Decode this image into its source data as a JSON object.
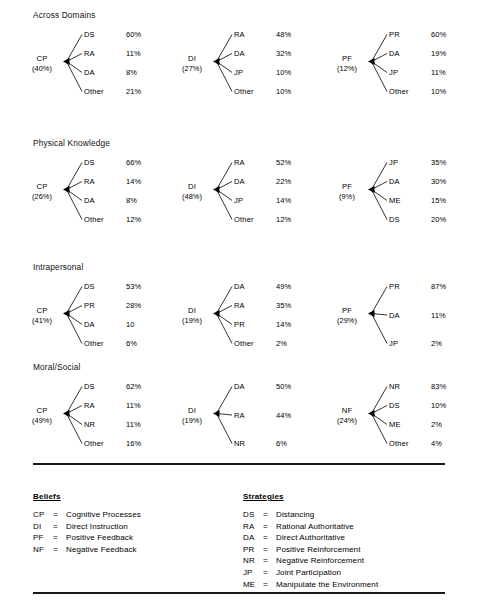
{
  "document": {
    "type": "tree-diagram-figure",
    "background_color": "#ffffff",
    "text_color": "#000000",
    "rule_color": "#1a1a1a"
  },
  "sections": [
    {
      "title": "Across Domains",
      "trees": [
        {
          "root_code": "CP",
          "root_pct": "(40%)",
          "leaves": [
            {
              "code": "DS",
              "value": "60%"
            },
            {
              "code": "RA",
              "value": "11%"
            },
            {
              "code": "DA",
              "value": "8%"
            },
            {
              "code": "Other",
              "value": "21%"
            }
          ]
        },
        {
          "root_code": "DI",
          "root_pct": "(27%)",
          "leaves": [
            {
              "code": "RA",
              "value": "48%"
            },
            {
              "code": "DA",
              "value": "32%"
            },
            {
              "code": "JP",
              "value": "10%"
            },
            {
              "code": "Other",
              "value": "10%"
            }
          ]
        },
        {
          "root_code": "PF",
          "root_pct": "(12%)",
          "leaves": [
            {
              "code": "PR",
              "value": "60%"
            },
            {
              "code": "DA",
              "value": "19%"
            },
            {
              "code": "JP",
              "value": "11%"
            },
            {
              "code": "Other",
              "value": "10%"
            }
          ]
        }
      ]
    },
    {
      "title": "Physical Knowledge",
      "trees": [
        {
          "root_code": "CP",
          "root_pct": "(26%)",
          "leaves": [
            {
              "code": "DS",
              "value": "66%"
            },
            {
              "code": "RA",
              "value": "14%"
            },
            {
              "code": "DA",
              "value": "8%"
            },
            {
              "code": "Other",
              "value": "12%"
            }
          ]
        },
        {
          "root_code": "DI",
          "root_pct": "(48%)",
          "leaves": [
            {
              "code": "RA",
              "value": "52%"
            },
            {
              "code": "DA",
              "value": "22%"
            },
            {
              "code": "JP",
              "value": "14%"
            },
            {
              "code": "Other",
              "value": "12%"
            }
          ]
        },
        {
          "root_code": "PF",
          "root_pct": "(9%)",
          "leaves": [
            {
              "code": "JP",
              "value": "35%"
            },
            {
              "code": "DA",
              "value": "30%"
            },
            {
              "code": "ME",
              "value": "15%"
            },
            {
              "code": "DS",
              "value": "20%"
            }
          ]
        }
      ]
    },
    {
      "title": "Intrapersonal",
      "trees": [
        {
          "root_code": "CP",
          "root_pct": "(41%)",
          "leaves": [
            {
              "code": "DS",
              "value": "53%"
            },
            {
              "code": "PR",
              "value": "28%"
            },
            {
              "code": "DA",
              "value": "10"
            },
            {
              "code": "Other",
              "value": "6%"
            }
          ]
        },
        {
          "root_code": "DI",
          "root_pct": "(19%)",
          "leaves": [
            {
              "code": "DA",
              "value": "49%"
            },
            {
              "code": "RA",
              "value": "35%"
            },
            {
              "code": "PR",
              "value": "14%"
            },
            {
              "code": "Other",
              "value": "2%"
            }
          ]
        },
        {
          "root_code": "PF",
          "root_pct": "(29%)",
          "leaves": [
            {
              "code": "PR",
              "value": "87%"
            },
            {
              "code": "DA",
              "value": "11%"
            },
            {
              "code": "JP",
              "value": "2%"
            }
          ]
        }
      ]
    },
    {
      "title": "Moral/Social",
      "trees": [
        {
          "root_code": "CP",
          "root_pct": "(49%)",
          "leaves": [
            {
              "code": "DS",
              "value": "62%"
            },
            {
              "code": "RA",
              "value": "11%"
            },
            {
              "code": "NR",
              "value": "11%"
            },
            {
              "code": "Other",
              "value": "16%"
            }
          ]
        },
        {
          "root_code": "DI",
          "root_pct": "(19%)",
          "leaves": [
            {
              "code": "DA",
              "value": "50%"
            },
            {
              "code": "RA",
              "value": "44%"
            },
            {
              "code": "NR",
              "value": "6%"
            }
          ]
        },
        {
          "root_code": "NF",
          "root_pct": "(24%)",
          "leaves": [
            {
              "code": "NR",
              "value": "83%"
            },
            {
              "code": "DS",
              "value": "10%"
            },
            {
              "code": "ME",
              "value": "2%"
            },
            {
              "code": "Other",
              "value": "4%"
            }
          ]
        }
      ]
    }
  ],
  "legend": {
    "beliefs": {
      "title": "Beliefs",
      "rows": [
        {
          "abbr": "CP",
          "eq": "=",
          "text": "Cognitive Processes"
        },
        {
          "abbr": "DI",
          "eq": "=",
          "text": "Direct Instruction"
        },
        {
          "abbr": "PF",
          "eq": "=",
          "text": "Positive Feedback"
        },
        {
          "abbr": "NF",
          "eq": "=",
          "text": "Negative Feedback"
        }
      ]
    },
    "strategies": {
      "title": "Strategies",
      "rows": [
        {
          "abbr": "DS",
          "eq": "=",
          "text": "Distancing"
        },
        {
          "abbr": "RA",
          "eq": "=",
          "text": "Rational Authoritative"
        },
        {
          "abbr": "DA",
          "eq": "=",
          "text": "Direct Authoritative"
        },
        {
          "abbr": "PR",
          "eq": "=",
          "text": "Positive Reinforcement"
        },
        {
          "abbr": "NR",
          "eq": "=",
          "text": "Negative Reinforcement"
        },
        {
          "abbr": "JP",
          "eq": "=",
          "text": "Joint Participation"
        },
        {
          "abbr": "ME",
          "eq": "=",
          "text": "Manipulate the Environment"
        }
      ]
    }
  },
  "chart_data": {
    "type": "tree",
    "sections": [
      {
        "domain": "Across Domains",
        "roots": [
          {
            "belief": "CP",
            "share": "40%",
            "branches": [
              [
                "DS",
                "60%"
              ],
              [
                "RA",
                "11%"
              ],
              [
                "DA",
                "8%"
              ],
              [
                "Other",
                "21%"
              ]
            ]
          },
          {
            "belief": "DI",
            "share": "27%",
            "branches": [
              [
                "RA",
                "48%"
              ],
              [
                "DA",
                "32%"
              ],
              [
                "JP",
                "10%"
              ],
              [
                "Other",
                "10%"
              ]
            ]
          },
          {
            "belief": "PF",
            "share": "12%",
            "branches": [
              [
                "PR",
                "60%"
              ],
              [
                "DA",
                "19%"
              ],
              [
                "JP",
                "11%"
              ],
              [
                "Other",
                "10%"
              ]
            ]
          }
        ]
      },
      {
        "domain": "Physical Knowledge",
        "roots": [
          {
            "belief": "CP",
            "share": "26%",
            "branches": [
              [
                "DS",
                "66%"
              ],
              [
                "RA",
                "14%"
              ],
              [
                "DA",
                "8%"
              ],
              [
                "Other",
                "12%"
              ]
            ]
          },
          {
            "belief": "DI",
            "share": "48%",
            "branches": [
              [
                "RA",
                "52%"
              ],
              [
                "DA",
                "22%"
              ],
              [
                "JP",
                "14%"
              ],
              [
                "Other",
                "12%"
              ]
            ]
          },
          {
            "belief": "PF",
            "share": "9%",
            "branches": [
              [
                "JP",
                "35%"
              ],
              [
                "DA",
                "30%"
              ],
              [
                "ME",
                "15%"
              ],
              [
                "DS",
                "20%"
              ]
            ]
          }
        ]
      },
      {
        "domain": "Intrapersonal",
        "roots": [
          {
            "belief": "CP",
            "share": "41%",
            "branches": [
              [
                "DS",
                "53%"
              ],
              [
                "PR",
                "28%"
              ],
              [
                "DA",
                "10"
              ],
              [
                "Other",
                "6%"
              ]
            ]
          },
          {
            "belief": "DI",
            "share": "19%",
            "branches": [
              [
                "DA",
                "49%"
              ],
              [
                "RA",
                "35%"
              ],
              [
                "PR",
                "14%"
              ],
              [
                "Other",
                "2%"
              ]
            ]
          },
          {
            "belief": "PF",
            "share": "29%",
            "branches": [
              [
                "PR",
                "87%"
              ],
              [
                "DA",
                "11%"
              ],
              [
                "JP",
                "2%"
              ]
            ]
          }
        ]
      },
      {
        "domain": "Moral/Social",
        "roots": [
          {
            "belief": "CP",
            "share": "49%",
            "branches": [
              [
                "DS",
                "62%"
              ],
              [
                "RA",
                "11%"
              ],
              [
                "NR",
                "11%"
              ],
              [
                "Other",
                "16%"
              ]
            ]
          },
          {
            "belief": "DI",
            "share": "19%",
            "branches": [
              [
                "DA",
                "50%"
              ],
              [
                "RA",
                "44%"
              ],
              [
                "NR",
                "6%"
              ]
            ]
          },
          {
            "belief": "NF",
            "share": "24%",
            "branches": [
              [
                "NR",
                "83%"
              ],
              [
                "DS",
                "10%"
              ],
              [
                "ME",
                "2%"
              ],
              [
                "Other",
                "4%"
              ]
            ]
          }
        ]
      }
    ]
  }
}
